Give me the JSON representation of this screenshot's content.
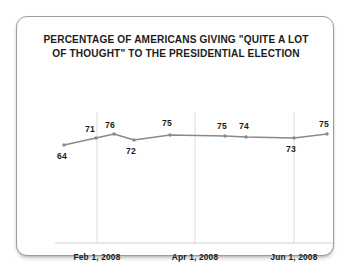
{
  "chart_data": {
    "type": "line",
    "title": "PERCENTAGE OF AMERICANS GIVING \"QUITE A LOT OF THOUGHT\" TO THE PRESIDENTIAL ELECTION",
    "title_lines": [
      "PERCENTAGE OF AMERICANS GIVING \"QUITE A LOT",
      "OF THOUGHT\" TO THE PRESIDENTIAL ELECTION"
    ],
    "xlabel": "",
    "ylabel": "",
    "ylim": [
      55,
      80
    ],
    "grid": "vertical-only",
    "legend": "none",
    "line_color": "#8a8a8a",
    "marker_color": "#8a8a8a",
    "gridline_color": "#dcdcdc",
    "axis_color": "#cfcfcf",
    "values": [
      64,
      71,
      76,
      72,
      75,
      75,
      74,
      73,
      75
    ],
    "points": [
      {
        "label": "64",
        "x": 47,
        "y": 128,
        "label_x": 40,
        "label_y": 134,
        "align": "below"
      },
      {
        "label": "71",
        "x": 79,
        "y": 121,
        "label_x": 68,
        "label_y": 107,
        "align": "above"
      },
      {
        "label": "76",
        "x": 97,
        "y": 117,
        "label_x": 88,
        "label_y": 103,
        "align": "above"
      },
      {
        "label": "72",
        "x": 117,
        "y": 123,
        "label_x": 109,
        "label_y": 129,
        "align": "below"
      },
      {
        "label": "75",
        "x": 153,
        "y": 118,
        "label_x": 145,
        "label_y": 101,
        "align": "above"
      },
      {
        "label": "75",
        "x": 208,
        "y": 119,
        "label_x": 200,
        "label_y": 104,
        "align": "above"
      },
      {
        "label": "74",
        "x": 229,
        "y": 120,
        "label_x": 222,
        "label_y": 104,
        "align": "above"
      },
      {
        "label": "73",
        "x": 277,
        "y": 121,
        "label_x": 269,
        "label_y": 127,
        "align": "below"
      },
      {
        "label": "75",
        "x": 310,
        "y": 117,
        "label_x": 302,
        "label_y": 102,
        "align": "above"
      }
    ],
    "tick_labels": [
      "Feb 1, 2008",
      "Apr 1, 2008",
      "Jun 1, 2008"
    ],
    "gridlines_x": [
      80,
      178,
      277
    ],
    "tick_positions_x": [
      80,
      178,
      277
    ],
    "axis_baseline_y": 226,
    "axis_x_start": 38,
    "axis_x_end": 318
  }
}
